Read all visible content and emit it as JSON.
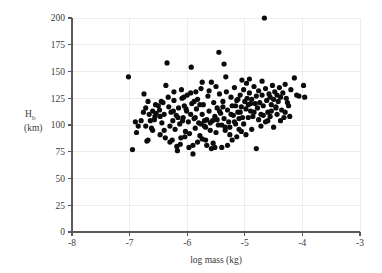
{
  "chart_data": {
    "type": "scatter",
    "title": "",
    "xlabel": "log mass (kg)",
    "ylabel_main": "H",
    "ylabel_sub": "b",
    "ylabel_units": "(km)",
    "xlim": [
      -8,
      -3
    ],
    "ylim": [
      0,
      200
    ],
    "xticks": [
      -8,
      -7,
      -6,
      -5,
      -4,
      -3
    ],
    "xticklabels": [
      "-8",
      "-7",
      "-6",
      "-5",
      "-4",
      "-3"
    ],
    "yticks": [
      0,
      25,
      50,
      75,
      100,
      125,
      150,
      175,
      200
    ],
    "yticklabels": [
      "0",
      "25",
      "50",
      "75",
      "100",
      "125",
      "150",
      "175",
      "200"
    ],
    "grid": true,
    "grid_color": "#e9e9ee",
    "marker_color": "#0b0b0b",
    "marker_size": 2.6,
    "legend": "none",
    "n_points": 213,
    "points": [
      [
        -7.02,
        145.0
      ],
      [
        -6.95,
        77.0
      ],
      [
        -6.88,
        93.0
      ],
      [
        -6.8,
        104.0
      ],
      [
        -6.75,
        129.0
      ],
      [
        -6.72,
        99.0
      ],
      [
        -6.7,
        85.0
      ],
      [
        -6.68,
        86.0
      ],
      [
        -6.66,
        110.0
      ],
      [
        -6.62,
        97.0
      ],
      [
        -6.6,
        113.0
      ],
      [
        -6.57,
        105.0
      ],
      [
        -6.54,
        111.0
      ],
      [
        -6.5,
        118.0
      ],
      [
        -6.47,
        108.0
      ],
      [
        -6.44,
        102.0
      ],
      [
        -6.42,
        121.0
      ],
      [
        -6.4,
        95.0
      ],
      [
        -6.37,
        137.0
      ],
      [
        -6.35,
        158.0
      ],
      [
        -6.33,
        126.0
      ],
      [
        -6.3,
        99.0
      ],
      [
        -6.28,
        112.0
      ],
      [
        -6.25,
        104.0
      ],
      [
        -6.23,
        123.0
      ],
      [
        -6.21,
        96.0
      ],
      [
        -6.19,
        109.0
      ],
      [
        -6.17,
        76.0
      ],
      [
        -6.15,
        116.0
      ],
      [
        -6.13,
        101.0
      ],
      [
        -6.11,
        88.0
      ],
      [
        -6.09,
        125.0
      ],
      [
        -6.07,
        107.0
      ],
      [
        -6.05,
        118.0
      ],
      [
        -6.03,
        94.0
      ],
      [
        -6.01,
        113.0
      ],
      [
        -6.0,
        128.0
      ],
      [
        -5.98,
        103.0
      ],
      [
        -5.96,
        92.0
      ],
      [
        -5.94,
        130.0
      ],
      [
        -5.92,
        120.0
      ],
      [
        -5.9,
        81.0
      ],
      [
        -5.88,
        106.0
      ],
      [
        -5.86,
        97.0
      ],
      [
        -5.84,
        115.0
      ],
      [
        -5.82,
        124.0
      ],
      [
        -5.8,
        102.0
      ],
      [
        -5.78,
        90.0
      ],
      [
        -5.76,
        134.0
      ],
      [
        -5.74,
        110.0
      ],
      [
        -5.72,
        119.0
      ],
      [
        -5.7,
        99.0
      ],
      [
        -5.68,
        86.0
      ],
      [
        -5.66,
        105.0
      ],
      [
        -5.64,
        127.0
      ],
      [
        -5.62,
        113.0
      ],
      [
        -5.6,
        95.0
      ],
      [
        -5.93,
        154.0
      ],
      [
        -5.58,
        140.0
      ],
      [
        -5.56,
        104.0
      ],
      [
        -5.54,
        121.0
      ],
      [
        -5.52,
        108.0
      ],
      [
        -5.5,
        93.0
      ],
      [
        -5.48,
        116.0
      ],
      [
        -5.46,
        100.0
      ],
      [
        -5.44,
        129.0
      ],
      [
        -5.42,
        111.0
      ],
      [
        -5.4,
        79.0
      ],
      [
        -5.38,
        122.0
      ],
      [
        -5.36,
        106.0
      ],
      [
        -5.34,
        98.0
      ],
      [
        -5.32,
        131.0
      ],
      [
        -5.3,
        114.0
      ],
      [
        -5.28,
        103.0
      ],
      [
        -5.26,
        91.0
      ],
      [
        -5.24,
        126.0
      ],
      [
        -5.22,
        118.0
      ],
      [
        -5.2,
        109.0
      ],
      [
        -5.18,
        135.0
      ],
      [
        -5.16,
        101.0
      ],
      [
        -5.14,
        123.0
      ],
      [
        -5.12,
        112.0
      ],
      [
        -5.1,
        96.0
      ],
      [
        -5.08,
        128.0
      ],
      [
        -5.06,
        117.0
      ],
      [
        -5.04,
        107.0
      ],
      [
        -5.02,
        133.0
      ],
      [
        -5.0,
        122.0
      ],
      [
        -4.98,
        115.0
      ],
      [
        -4.96,
        125.0
      ],
      [
        -4.94,
        119.0
      ],
      [
        -4.92,
        130.0
      ],
      [
        -4.9,
        113.0
      ],
      [
        -4.88,
        124.0
      ],
      [
        -4.86,
        108.0
      ],
      [
        -4.84,
        136.0
      ],
      [
        -4.82,
        120.0
      ],
      [
        -4.8,
        127.0
      ],
      [
        -4.78,
        116.0
      ],
      [
        -4.76,
        132.0
      ],
      [
        -4.74,
        121.0
      ],
      [
        -4.72,
        110.0
      ],
      [
        -4.7,
        128.0
      ],
      [
        -4.68,
        118.0
      ],
      [
        -4.66,
        200.0
      ],
      [
        -4.64,
        134.0
      ],
      [
        -4.62,
        123.0
      ],
      [
        -4.6,
        112.0
      ],
      [
        -4.58,
        129.0
      ],
      [
        -4.56,
        126.0
      ],
      [
        -4.54,
        119.0
      ],
      [
        -4.52,
        137.0
      ],
      [
        -4.5,
        124.0
      ],
      [
        -4.48,
        131.0
      ],
      [
        -4.46,
        117.0
      ],
      [
        -4.44,
        128.0
      ],
      [
        -4.42,
        122.0
      ],
      [
        -4.4,
        135.0
      ],
      [
        -4.38,
        126.0
      ],
      [
        -4.36,
        114.0
      ],
      [
        -4.34,
        130.0
      ],
      [
        -4.32,
        107.0
      ],
      [
        -4.3,
        138.0
      ],
      [
        -4.28,
        125.0
      ],
      [
        -4.26,
        121.0
      ],
      [
        -4.2,
        133.0
      ],
      [
        -4.14,
        144.0
      ],
      [
        -4.1,
        128.0
      ],
      [
        -4.06,
        127.0
      ],
      [
        -3.98,
        137.0
      ],
      [
        -3.96,
        126.0
      ],
      [
        -4.24,
        118.0
      ],
      [
        -5.45,
        168.0
      ],
      [
        -5.36,
        157.0
      ],
      [
        -5.33,
        145.0
      ],
      [
        -5.05,
        142.0
      ],
      [
        -4.97,
        139.0
      ],
      [
        -4.92,
        143.0
      ],
      [
        -4.7,
        141.0
      ],
      [
        -5.62,
        132.0
      ],
      [
        -5.5,
        136.0
      ],
      [
        -5.74,
        140.0
      ],
      [
        -5.85,
        131.0
      ],
      [
        -6.1,
        133.0
      ],
      [
        -6.23,
        131.0
      ],
      [
        -6.45,
        122.0
      ],
      [
        -6.55,
        119.0
      ],
      [
        -6.68,
        122.0
      ],
      [
        -6.72,
        116.0
      ],
      [
        -6.85,
        99.0
      ],
      [
        -6.9,
        103.0
      ],
      [
        -6.6,
        95.0
      ],
      [
        -6.47,
        91.0
      ],
      [
        -6.38,
        88.0
      ],
      [
        -6.3,
        84.0
      ],
      [
        -6.26,
        86.0
      ],
      [
        -6.18,
        80.0
      ],
      [
        -6.12,
        82.0
      ],
      [
        -6.04,
        89.0
      ],
      [
        -5.97,
        79.0
      ],
      [
        -5.9,
        73.0
      ],
      [
        -5.82,
        84.0
      ],
      [
        -5.74,
        87.0
      ],
      [
        -5.66,
        81.0
      ],
      [
        -5.58,
        78.0
      ],
      [
        -5.55,
        83.0
      ],
      [
        -5.52,
        79.0
      ],
      [
        -5.3,
        81.0
      ],
      [
        -5.22,
        86.0
      ],
      [
        -5.14,
        89.0
      ],
      [
        -5.06,
        94.0
      ],
      [
        -4.98,
        91.0
      ],
      [
        -4.88,
        96.0
      ],
      [
        -4.8,
        78.0
      ],
      [
        -4.72,
        99.0
      ],
      [
        -4.64,
        103.0
      ],
      [
        -4.56,
        108.0
      ],
      [
        -4.5,
        98.0
      ],
      [
        -4.44,
        110.0
      ],
      [
        -4.38,
        104.0
      ],
      [
        -4.3,
        112.0
      ],
      [
        -4.22,
        108.0
      ],
      [
        -5.7,
        104.0
      ],
      [
        -5.76,
        101.0
      ],
      [
        -5.68,
        98.0
      ],
      [
        -5.6,
        102.0
      ],
      [
        -5.48,
        105.0
      ],
      [
        -5.4,
        100.0
      ],
      [
        -5.34,
        95.0
      ],
      [
        -5.26,
        98.0
      ],
      [
        -5.18,
        103.0
      ],
      [
        -5.1,
        106.0
      ],
      [
        -5.86,
        107.0
      ],
      [
        -5.94,
        110.0
      ],
      [
        -6.02,
        115.0
      ],
      [
        -6.08,
        104.0
      ],
      [
        -6.16,
        107.0
      ],
      [
        -6.24,
        113.0
      ],
      [
        -6.32,
        117.0
      ],
      [
        -6.4,
        110.0
      ],
      [
        -6.48,
        114.0
      ],
      [
        -6.56,
        108.0
      ],
      [
        -6.64,
        104.0
      ],
      [
        -6.76,
        112.0
      ],
      [
        -4.84,
        112.0
      ],
      [
        -4.76,
        105.0
      ],
      [
        -4.68,
        109.0
      ],
      [
        -5.02,
        101.0
      ],
      [
        -5.08,
        112.0
      ],
      [
        -4.94,
        107.0
      ],
      [
        -4.9,
        120.0
      ],
      [
        -5.16,
        118.0
      ],
      [
        -5.24,
        110.0
      ],
      [
        -4.46,
        116.0
      ],
      [
        -4.54,
        113.0
      ],
      [
        -4.6,
        104.0
      ],
      [
        -5.78,
        119.0
      ],
      [
        -5.88,
        122.0
      ],
      [
        -6.06,
        126.0
      ],
      [
        -5.44,
        113.0
      ],
      [
        -5.38,
        117.0
      ],
      [
        -5.12,
        124.0
      ]
    ]
  },
  "axis": {
    "x_title": "log mass (kg)",
    "y_title_main": "H",
    "y_title_sub": "b",
    "y_title_units": "(km)"
  }
}
